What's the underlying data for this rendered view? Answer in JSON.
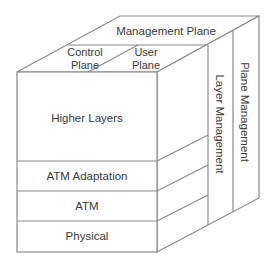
{
  "diagram": {
    "top_face": {
      "management_plane": "Management Plane",
      "control_plane": [
        "Control",
        "Plane"
      ],
      "user_plane": [
        "User",
        "Plane"
      ]
    },
    "front_face": {
      "layers": [
        "Higher Layers",
        "ATM Adaptation",
        "ATM",
        "Physical"
      ]
    },
    "side_face": {
      "layer_management": "Layer Management",
      "plane_management": "Plane Management"
    },
    "colors": {
      "line": "#8a8a8a",
      "text": "#3a3a3a",
      "background": "#ffffff"
    }
  }
}
